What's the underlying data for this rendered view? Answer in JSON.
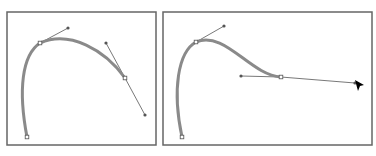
{
  "figure": {
    "panels": [
      {
        "name": "left-panel",
        "frame": {
          "x": 7,
          "y": 12,
          "w": 149,
          "h": 133
        },
        "curve_path": "M27,137 C18,90 22,55 40,43 C70,30 105,50 125,78",
        "anchors": [
          [
            27,
            137
          ],
          [
            40,
            43
          ],
          [
            125,
            78
          ]
        ],
        "handles": [
          {
            "from": [
              40,
              43
            ],
            "to": [
              68,
              28
            ]
          },
          {
            "from": [
              125,
              78
            ],
            "to": [
              106,
              43
            ]
          },
          {
            "from": [
              125,
              78
            ],
            "to": [
              145,
              115
            ]
          }
        ]
      },
      {
        "name": "right-panel",
        "frame": {
          "x": 163,
          "y": 12,
          "w": 209,
          "h": 133
        },
        "curve_path": "M182,137 C172,90 178,52 196,42 C225,30 250,75 281,77",
        "anchors": [
          [
            182,
            137
          ],
          [
            196,
            42
          ],
          [
            281,
            77
          ]
        ],
        "handles": [
          {
            "from": [
              196,
              42
            ],
            "to": [
              224,
              26
            ]
          },
          {
            "from": [
              281,
              77
            ],
            "to": [
              241,
              76
            ]
          },
          {
            "from": [
              281,
              77
            ],
            "to": [
              355,
              83
            ]
          }
        ],
        "cursor": {
          "x": 355,
          "y": 80
        }
      }
    ],
    "colors": {
      "frame": "#666666",
      "curve": "#8a8a8a",
      "handle": "#555555",
      "cursor": "#000000"
    }
  }
}
